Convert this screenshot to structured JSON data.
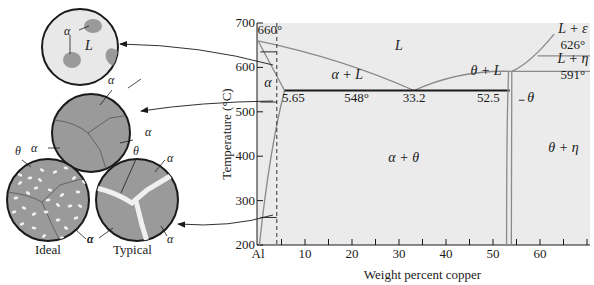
{
  "diagram": {
    "type": "phase-diagram",
    "system": "Al-Cu",
    "x_axis": {
      "title": "Weight percent copper",
      "range": [
        0,
        70
      ],
      "ticks": [
        {
          "value": 0,
          "label": "Al"
        },
        {
          "value": 10,
          "label": "10"
        },
        {
          "value": 20,
          "label": "20"
        },
        {
          "value": 30,
          "label": "30"
        },
        {
          "value": 40,
          "label": "40"
        },
        {
          "value": 50,
          "label": "50"
        },
        {
          "value": 60,
          "label": "60"
        }
      ],
      "minor_ticks": [
        5,
        15,
        25,
        35,
        45,
        55,
        65,
        70
      ]
    },
    "y_axis": {
      "title": "Temperature (°C)",
      "range": [
        200,
        700
      ],
      "ticks": [
        {
          "value": 200,
          "label": "200"
        },
        {
          "value": 300,
          "label": "300"
        },
        {
          "value": 400,
          "label": "400"
        },
        {
          "value": 500,
          "label": "500"
        },
        {
          "value": 600,
          "label": "600"
        },
        {
          "value": 700,
          "label": "700"
        }
      ]
    },
    "regions": [
      {
        "name": "liquid",
        "label": "L",
        "x": 30,
        "y": 640
      },
      {
        "name": "alpha-plus-liquid",
        "label": "α + L",
        "x": 19,
        "y": 575
      },
      {
        "name": "alpha",
        "label": "α",
        "x": 2.1,
        "y": 555
      },
      {
        "name": "alpha-plus-theta",
        "label": "α + θ",
        "x": 31,
        "y": 388
      },
      {
        "name": "theta-plus-liquid",
        "label": "θ + L",
        "x": 48.5,
        "y": 584
      },
      {
        "name": "theta",
        "label": "θ",
        "x": 58,
        "y": 522
      },
      {
        "name": "theta-plus-eta",
        "label": "θ + η",
        "x": 65,
        "y": 410
      },
      {
        "name": "liquid-plus-epsilon",
        "label": "L + ε",
        "x": 67,
        "y": 678
      },
      {
        "name": "liquid-plus-eta",
        "label": "L + η",
        "x": 67,
        "y": 610
      }
    ],
    "annotations": [
      {
        "name": "melting-point-al",
        "label": "660°",
        "x": 2.5,
        "y": 675
      },
      {
        "name": "alpha-solubility-limit",
        "label": "5.65",
        "x": 7.5,
        "y": 523
      },
      {
        "name": "eutectic-temperature",
        "label": "548°",
        "x": 21,
        "y": 523
      },
      {
        "name": "eutectic-composition",
        "label": "33.2",
        "x": 33.2,
        "y": 523
      },
      {
        "name": "theta-composition",
        "label": "52.5",
        "x": 49,
        "y": 523
      },
      {
        "name": "peritectic-626",
        "label": "626°",
        "x": 67,
        "y": 642
      },
      {
        "name": "peritectic-591",
        "label": "591°",
        "x": 67,
        "y": 575
      }
    ],
    "key_points": {
      "al_melting_point_C": 660,
      "eutectic_temperature_C": 548,
      "eutectic_composition_wt_pct": 33.2,
      "alpha_max_solubility_wt_pct": 5.65,
      "theta_composition_wt_pct": 52.5,
      "peritectic_temps_C": [
        626,
        591
      ],
      "alloy_composition_wt_pct": 4
    }
  },
  "microstructures": [
    {
      "name": "liquid-with-alpha",
      "labels": [
        "α",
        "L"
      ]
    },
    {
      "name": "alpha-solid-solution",
      "labels": [
        "α",
        "α",
        "α"
      ]
    },
    {
      "name": "ideal",
      "caption": "Ideal",
      "labels": [
        "θ",
        "α"
      ]
    },
    {
      "name": "typical",
      "caption": "Typical",
      "labels": [
        "θ",
        "α",
        "α",
        "α"
      ]
    }
  ],
  "colors": {
    "plot_bg": "#ebebeb",
    "phase_line": "#8a8a8a",
    "eutectic_line": "#1a1a1a",
    "circle_light": "#e8e8e8",
    "grain_fill": "#9a9a9a",
    "precipitate": "#f0f0f0"
  }
}
